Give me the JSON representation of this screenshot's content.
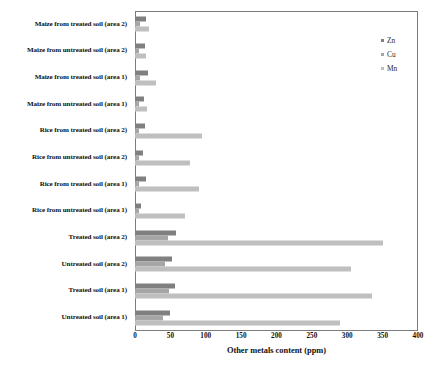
{
  "chart_data": {
    "type": "bar",
    "orientation": "horizontal",
    "title": "",
    "xlabel": "Other metals content (ppm)",
    "ylabel": "",
    "xlim": [
      0,
      400
    ],
    "xticks": [
      0,
      50,
      100,
      150,
      200,
      250,
      300,
      350,
      400
    ],
    "grid": false,
    "legend_position": "top-right",
    "categories": [
      "Maize from treated soil (area 2)",
      "Maize from untreated soil (area 2)",
      "Maize from treated soil (area 1)",
      "Maize from untreated soil (area 1)",
      "Rice from treated soil (area 2)",
      "Rice from untreated soil (area 2)",
      "Rice from treated soil (area 1)",
      "Rice from untreated soil (area 1)",
      "Treated soil (area 2)",
      "Untreated soil (area 2)",
      "Treated soil (area 1)",
      "Untreated soil (area 1)"
    ],
    "series": [
      {
        "name": "Zn",
        "color": "#808080",
        "values": [
          16,
          14,
          19,
          13,
          14,
          12,
          15,
          9,
          58,
          52,
          57,
          50
        ]
      },
      {
        "name": "Cu",
        "color": "#a6a6a6",
        "values": [
          7,
          6,
          7,
          6,
          6,
          5,
          6,
          5,
          46,
          42,
          48,
          40
        ]
      },
      {
        "name": "Mn",
        "color": "#bfbfbf",
        "values": [
          20,
          16,
          30,
          17,
          95,
          78,
          90,
          70,
          350,
          305,
          335,
          290
        ]
      }
    ]
  },
  "legend": {
    "items": [
      {
        "label": "Zn"
      },
      {
        "label": "Cu"
      },
      {
        "label": "Mn"
      }
    ]
  }
}
